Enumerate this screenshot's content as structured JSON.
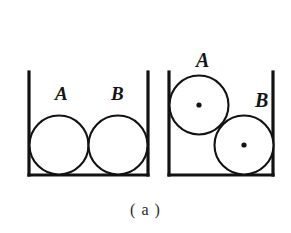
{
  "figure": {
    "caption": "( a )",
    "panels": [
      {
        "id": "left-panel",
        "name": "balls-side-by-side-in-container",
        "container": {
          "name": "open-top-container",
          "left_x": 29,
          "right_x": 148,
          "top_y": 72,
          "bottom_y": 175,
          "stroke_color": "#121212",
          "stroke_width": 3.2
        },
        "balls": [
          {
            "label": "A",
            "cx": 59,
            "cy": 145,
            "r": 29.5,
            "has_center_dot": false,
            "label_x": 55,
            "label_y": 100
          },
          {
            "label": "B",
            "cx": 118,
            "cy": 145,
            "r": 29.5,
            "has_center_dot": false,
            "label_x": 111,
            "label_y": 100
          }
        ]
      },
      {
        "id": "right-panel",
        "name": "balls-stacked-diagonally-in-container",
        "container": {
          "name": "open-top-container",
          "left_x": 169,
          "right_x": 273,
          "top_y": 72,
          "bottom_y": 175,
          "stroke_color": "#121212",
          "stroke_width": 3.2
        },
        "balls": [
          {
            "label": "A",
            "cx": 199,
            "cy": 105,
            "r": 29.5,
            "has_center_dot": true,
            "label_x": 196,
            "label_y": 67
          },
          {
            "label": "B",
            "cx": 244,
            "cy": 145,
            "r": 29.5,
            "has_center_dot": true,
            "label_x": 255,
            "label_y": 107
          }
        ]
      }
    ]
  },
  "colors": {
    "ink": "#121212",
    "paper": "#ffffff",
    "caption_ink": "#2a2a2a"
  }
}
